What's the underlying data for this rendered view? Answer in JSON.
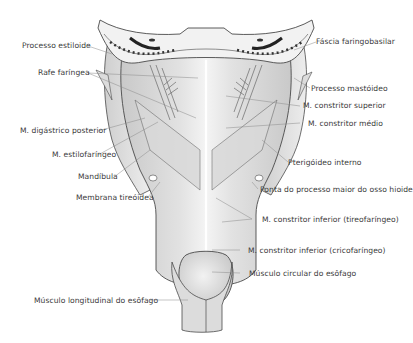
{
  "figure": {
    "colors": {
      "muscle": "#d6d6d6",
      "muscle_light": "#ececec",
      "outline": "#4a4a4a",
      "bone": "#f2f2f2",
      "bone_marrow": "#3a3a3a",
      "leader_line": "#8a8a8a",
      "text": "#3a3a3a"
    }
  },
  "labels": {
    "left": [
      {
        "id": "processo-estiloide",
        "text": "Processo estiloide"
      },
      {
        "id": "rafe-faringea",
        "text": "Rafe faríngea"
      },
      {
        "id": "digastrico-posterior",
        "text": "M. digástrico posterior"
      },
      {
        "id": "estilofaringeo",
        "text": "M. estilofaríngeo"
      },
      {
        "id": "mandibula",
        "text": "Mandíbula"
      },
      {
        "id": "membrana-tireoidea",
        "text": "Membrana tireóidea"
      },
      {
        "id": "musculo-longitudinal",
        "text": "Músculo longitudinal do esôfago"
      }
    ],
    "right": [
      {
        "id": "fascia-faringobasilar",
        "text": "Fáscia faringobasilar"
      },
      {
        "id": "processo-mastoideo",
        "text": "Processo mastóideo"
      },
      {
        "id": "constritor-superior",
        "text": "M. constritor superior"
      },
      {
        "id": "constritor-medio",
        "text": "M. constritor médio"
      },
      {
        "id": "pterigoideo-interno",
        "text": "Pterigóideo interno"
      },
      {
        "id": "ponta-hioide",
        "text": "Ponta do processo maior do osso hioide"
      },
      {
        "id": "constritor-inferior-tireo",
        "text": "M. constritor inferior (tireofaríngeo)"
      },
      {
        "id": "constritor-inferior-crico",
        "text": "M. constritor inferior (cricofaríngeo)"
      },
      {
        "id": "musculo-circular",
        "text": "Músculo circular do esôfago"
      }
    ]
  }
}
